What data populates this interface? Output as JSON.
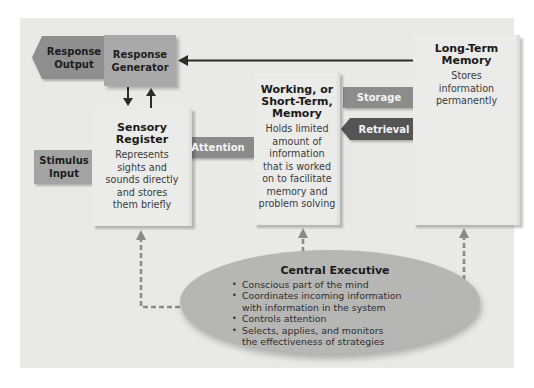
{
  "diagram": {
    "nodes": {
      "response_output": {
        "label": "Response\nOutput",
        "line1": "Response",
        "line2": "Output"
      },
      "response_generator": {
        "line1": "Response",
        "line2": "Generator"
      },
      "sensory_register": {
        "title_line1": "Sensory",
        "title_line2": "Register",
        "desc": [
          "Represents",
          "sights and",
          "sounds directly",
          "and stores",
          "them briefly"
        ]
      },
      "stimulus_input": {
        "line1": "Stimulus",
        "line2": "Input"
      },
      "working_memory": {
        "title_line1": "Working, or",
        "title_line2": "Short-Term,",
        "title_line3": "Memory",
        "desc": [
          "Holds limited",
          "amount of",
          "information",
          "that is worked",
          "on to facilitate",
          "memory and",
          "problem solving"
        ]
      },
      "long_term_memory": {
        "title_line1": "Long-Term",
        "title_line2": "Memory",
        "desc": [
          "Stores",
          "information",
          "permanently"
        ]
      },
      "central_executive": {
        "title": "Central Executive",
        "bullets": [
          "Conscious part of the mind",
          "Coordinates incoming information with information in the system",
          "Controls attention",
          "Selects, applies, and monitors the effectiveness of strategies"
        ],
        "bullet_lines": [
          [
            "Conscious part of the mind"
          ],
          [
            "Coordinates incoming information",
            "with information in the system"
          ],
          [
            "Controls attention"
          ],
          [
            "Selects, applies, and monitors",
            "the effectiveness of strategies"
          ]
        ]
      }
    },
    "edges": {
      "attention": "Attention",
      "storage": "Storage",
      "retrieval": "Retrieval"
    },
    "colors": {
      "panel_bg": "#e9e9e8",
      "box_bg": "#ebebea",
      "generator_bg": "#a9a9a9",
      "response_output_bg": "#8f8f8f",
      "stimulus_input_bg": "#a3a3a3",
      "attention_bg": "#8a8a8a",
      "storage_bg": "#8c8c8c",
      "retrieval_bg": "#555555",
      "ellipse_bg": "#b6b6b5",
      "arrow_dark": "#2b2b2b",
      "dashed_arrow": "#8a8a8a"
    }
  }
}
